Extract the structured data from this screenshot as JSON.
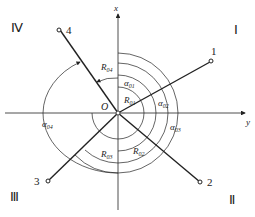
{
  "diagram": {
    "axes": {
      "x": "x",
      "y": "y",
      "origin": "O"
    },
    "quadrants": [
      "Ⅰ",
      "Ⅱ",
      "Ⅲ",
      "Ⅳ"
    ],
    "arms": [
      {
        "id": "1",
        "label": "1",
        "radius_label": "R",
        "radius_sub": "01",
        "angle_label": "α",
        "angle_sub": "01"
      },
      {
        "id": "2",
        "label": "2",
        "radius_label": "R",
        "radius_sub": "02",
        "angle_label": "α",
        "angle_sub": "02"
      },
      {
        "id": "3",
        "label": "3",
        "radius_label": "R",
        "radius_sub": "03",
        "angle_label": "α",
        "angle_sub": "03"
      },
      {
        "id": "4",
        "label": "4",
        "radius_label": "R",
        "radius_sub": "04",
        "angle_label": "α",
        "angle_sub": "04"
      }
    ]
  }
}
